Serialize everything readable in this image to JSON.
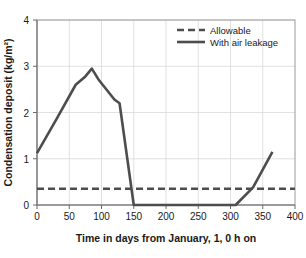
{
  "chart_data": {
    "type": "line",
    "title": "",
    "xlabel": "Time in days from January, 1, 0 h on",
    "ylabel": "Condensation deposit (kg/m²)",
    "xlim": [
      0,
      400
    ],
    "ylim": [
      0,
      4
    ],
    "xticks": [
      0,
      50,
      100,
      150,
      200,
      250,
      300,
      350,
      400
    ],
    "xtick_labels": [
      "0",
      "50",
      "100",
      "150",
      "200",
      "250",
      "300",
      "350",
      "400"
    ],
    "yticks": [
      0,
      1,
      2,
      3,
      4
    ],
    "ytick_labels": [
      "0",
      "1",
      "2",
      "3",
      "4"
    ],
    "grid": true,
    "legend_position": "top-right",
    "series": [
      {
        "name": "Allowable",
        "style": "dashed",
        "color": "#4d4d4d",
        "x": [
          0,
          400
        ],
        "values": [
          0.35,
          0.35
        ]
      },
      {
        "name": "With air leakage",
        "style": "solid",
        "color": "#4d4d4d",
        "x": [
          0,
          30,
          60,
          75,
          85,
          95,
          120,
          128,
          150,
          155,
          300,
          308,
          335,
          365
        ],
        "values": [
          1.12,
          1.85,
          2.6,
          2.78,
          2.95,
          2.72,
          2.28,
          2.2,
          0.0,
          0.0,
          0.0,
          0.0,
          0.38,
          1.15
        ]
      }
    ]
  },
  "legend": {
    "entries": [
      {
        "label": "Allowable"
      },
      {
        "label": "With air leakage"
      }
    ]
  },
  "colors": {
    "series": "#4d4d4d",
    "grid": "#d9d9d9",
    "border": "#9a9a9a",
    "text": "#1a1a1a",
    "background": "#ffffff"
  }
}
